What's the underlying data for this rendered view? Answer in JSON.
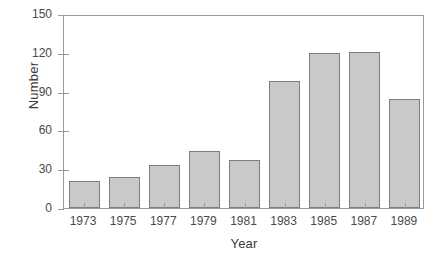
{
  "chart_data": {
    "type": "bar",
    "title": "",
    "xlabel": "Year",
    "ylabel": "Number",
    "categories": [
      "1973",
      "1975",
      "1977",
      "1979",
      "1981",
      "1983",
      "1985",
      "1987",
      "1989"
    ],
    "values": [
      21,
      24,
      33,
      44,
      37,
      98,
      120,
      121,
      84
    ],
    "ylim": [
      0,
      150
    ],
    "yticks": [
      0,
      30,
      60,
      90,
      120,
      150
    ],
    "ytick_labels": [
      "0",
      "30",
      "60",
      "90",
      "120",
      "150"
    ],
    "grid": false,
    "legend": false,
    "legend_position": "none",
    "bar_color": "#c9c9c9",
    "bar_edge_color": "#7d7d7d",
    "axis_color": "#9a9a9a",
    "text_color": "#3b3b3b"
  }
}
